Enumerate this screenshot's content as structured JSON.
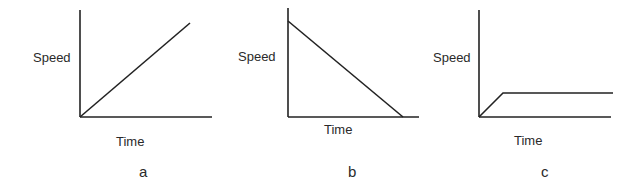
{
  "graphs": [
    {
      "id": "a",
      "caption": "a",
      "ylabel": "Speed",
      "xlabel": "Time",
      "description": "Speed increases linearly with time (constant acceleration)"
    },
    {
      "id": "b",
      "caption": "b",
      "ylabel": "Speed",
      "xlabel": "Time",
      "description": "Speed decreases linearly with time to zero (constant deceleration)"
    },
    {
      "id": "c",
      "caption": "c",
      "ylabel": "Speed",
      "xlabel": "Time",
      "description": "Speed increases briefly then stays constant"
    }
  ],
  "colors": {
    "line": "#222222",
    "text": "#2a2a2a",
    "background": "#ffffff"
  }
}
